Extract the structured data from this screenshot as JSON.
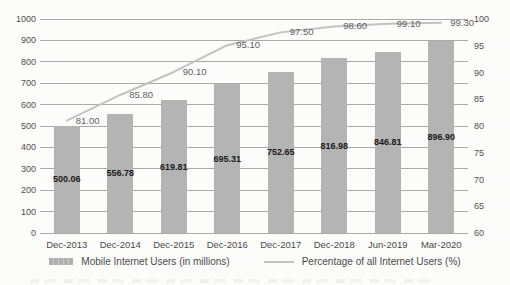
{
  "chart_data": {
    "type": "bar",
    "subtype": "combo-bar-line-dual-axis",
    "title": "",
    "xlabel": "",
    "ylabel": "",
    "grid": true,
    "legend_position": "bottom",
    "categories": [
      "Dec-2013",
      "Dec-2014",
      "Dec-2015",
      "Dec-2016",
      "Dec-2017",
      "Dec-2018",
      "Jun-2019",
      "Mar-2020"
    ],
    "series": [
      {
        "name": "Mobile Internet Users (in millions)",
        "type": "bar",
        "axis": "left",
        "color": "#b4b4b4",
        "values": [
          500.06,
          556.78,
          619.81,
          695.31,
          752.65,
          816.98,
          846.81,
          896.9
        ],
        "labels": [
          "500.06",
          "556.78",
          "619.81",
          "695.31",
          "752.65",
          "816.98",
          "846.81",
          "896.90"
        ]
      },
      {
        "name": "Percentage of all Internet Users (%)",
        "type": "line",
        "axis": "right",
        "color": "#c2c2c2",
        "values": [
          81.0,
          85.8,
          90.1,
          95.1,
          97.5,
          98.6,
          99.1,
          99.3
        ],
        "labels": [
          "81.00",
          "85.80",
          "90.10",
          "95.10",
          "97.50",
          "98.60",
          "99.10",
          "99.30"
        ]
      }
    ],
    "left_axis": {
      "min": 0,
      "max": 1000,
      "step": 100,
      "ticks": [
        "1000",
        "900",
        "800",
        "700",
        "600",
        "500",
        "400",
        "300",
        "200",
        "100",
        "0"
      ]
    },
    "right_axis": {
      "min": 60,
      "max": 100,
      "step": 5,
      "ticks": [
        "100",
        "95",
        "90",
        "85",
        "80",
        "75",
        "70",
        "65",
        "60"
      ]
    }
  },
  "legend": {
    "items": [
      {
        "label": "Mobile Internet Users (in millions)",
        "swatch": "bar"
      },
      {
        "label": "Percentage of all Internet Users (%)",
        "swatch": "line"
      }
    ]
  },
  "colors": {
    "background": "#fcfcfa",
    "bar": "#b4b4b4",
    "line": "#c2c2c2",
    "gridline": "#8f8f8f",
    "tick_text": "#4f4f4f",
    "bar_label_text": "#1a1a1a",
    "line_label_text": "#5f5f5f"
  }
}
